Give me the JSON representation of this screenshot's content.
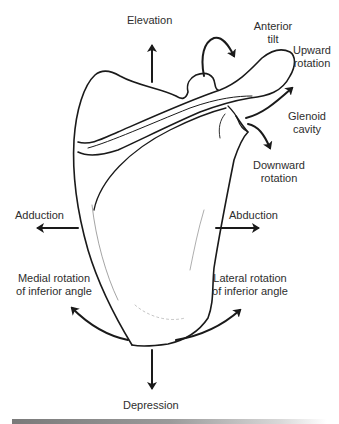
{
  "diagram": {
    "labels": {
      "elevation": "Elevation",
      "anterior_tilt_line1": "Anterior",
      "anterior_tilt_line2": "tilt",
      "upward_rotation_line1": "Upward",
      "upward_rotation_line2": "rotation",
      "glenoid_cavity_line1": "Glenoid",
      "glenoid_cavity_line2": "cavity",
      "downward_rotation_line1": "Downward",
      "downward_rotation_line2": "rotation",
      "adduction": "Adduction",
      "abduction": "Abduction",
      "medial_rotation_line1": "Medial rotation",
      "medial_rotation_line2": "of inferior angle",
      "lateral_rotation_line1": "Lateral rotation",
      "lateral_rotation_line2": "of inferior angle",
      "depression": "Depression"
    },
    "arrows": [
      {
        "name": "elevation",
        "direction": "up"
      },
      {
        "name": "anterior-tilt",
        "direction": "curved-forward"
      },
      {
        "name": "upward-rotation",
        "direction": "up-right"
      },
      {
        "name": "downward-rotation",
        "direction": "down-right"
      },
      {
        "name": "adduction",
        "direction": "left"
      },
      {
        "name": "abduction",
        "direction": "right"
      },
      {
        "name": "medial-rotation",
        "direction": "curved-up-left"
      },
      {
        "name": "lateral-rotation",
        "direction": "curved-up-right"
      },
      {
        "name": "depression",
        "direction": "down"
      }
    ],
    "colors": {
      "line": "#1a1a1a",
      "text": "#2e2e2e",
      "background": "#ffffff"
    }
  }
}
